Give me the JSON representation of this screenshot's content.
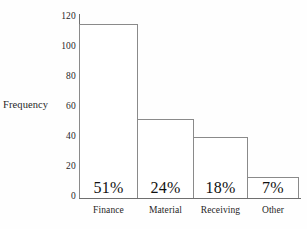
{
  "chart_data": {
    "type": "bar",
    "title": "",
    "subtitle": "",
    "xlabel": "",
    "ylabel": "Frequency",
    "categories": [
      "Finance",
      "Material",
      "Receiving",
      "Other"
    ],
    "values": [
      115,
      52,
      40,
      14
    ],
    "data_labels": [
      "51%",
      "24%",
      "18%",
      "7%"
    ],
    "yticks": [
      0,
      20,
      40,
      60,
      80,
      100,
      120
    ],
    "ytick_labels": [
      "0",
      "20",
      "40",
      "60",
      "80",
      "100",
      "120"
    ],
    "ylim": [
      0,
      120
    ],
    "grid": false,
    "legend": false,
    "legend_position": "none",
    "bar_fill": "#ffffff",
    "bar_edge": "#8a8a8a",
    "axis_color": "#6f6f6f",
    "text_color": "#1a1a1a",
    "background": "#fefefe"
  }
}
